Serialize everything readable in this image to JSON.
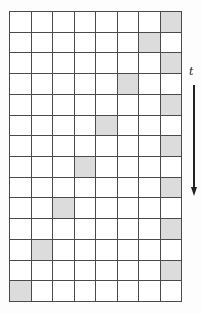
{
  "figure": {
    "grid": {
      "rows": 14,
      "cols": 8,
      "line_color": "#4a4a4a",
      "cell_fill": "#ffffff",
      "shaded_fill": "#dcdcdc",
      "shaded_cells": [
        {
          "row": 1,
          "col": 8
        },
        {
          "row": 2,
          "col": 7
        },
        {
          "row": 3,
          "col": 8
        },
        {
          "row": 4,
          "col": 6
        },
        {
          "row": 5,
          "col": 8
        },
        {
          "row": 6,
          "col": 5
        },
        {
          "row": 7,
          "col": 8
        },
        {
          "row": 8,
          "col": 4
        },
        {
          "row": 9,
          "col": 8
        },
        {
          "row": 10,
          "col": 3
        },
        {
          "row": 11,
          "col": 8
        },
        {
          "row": 12,
          "col": 2
        },
        {
          "row": 13,
          "col": 8
        },
        {
          "row": 14,
          "col": 1
        }
      ]
    },
    "time_axis": {
      "label": "t",
      "direction": "down",
      "arrow_color": "#222222"
    }
  }
}
